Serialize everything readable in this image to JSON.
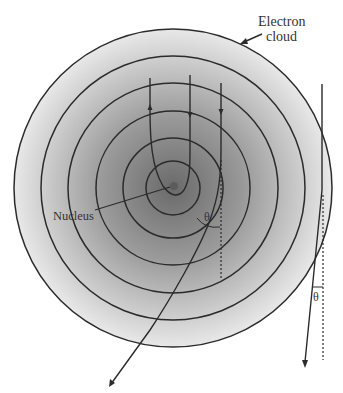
{
  "diagram": {
    "labels": {
      "electron_cloud_line1": "Electron",
      "electron_cloud_line2": "cloud",
      "nucleus": "Nucleus",
      "angle_inner": "θ",
      "angle_outer": "θ"
    },
    "colors": {
      "stroke": "#2b2b2b",
      "cloud_center": "#6e6e6e",
      "cloud_edge": "#e6e6e6",
      "background": "#ffffff"
    },
    "cloud": {
      "center": [
        173,
        188
      ],
      "ring_radii": [
        159,
        132,
        105,
        77,
        50,
        27
      ]
    },
    "paths": [
      {
        "name": "backscattered-path",
        "description": "enters downward, loops around nucleus, exits upward"
      },
      {
        "name": "near-nucleus-path",
        "description": "downward path bending close to nucleus"
      },
      {
        "name": "large-deflection-path",
        "description": "deflected by angle θ toward lower-left"
      },
      {
        "name": "small-deflection-path",
        "description": "outside path deflected by small angle θ"
      }
    ]
  }
}
